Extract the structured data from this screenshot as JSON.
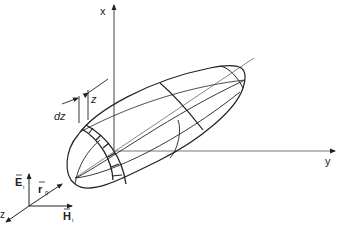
{
  "diagram": {
    "type": "3d-ellipsoid-coordinate-system",
    "axes": {
      "x_label": "x",
      "y_label": "y",
      "z_label": "z"
    },
    "annotations": {
      "slice_position": "z",
      "slice_thickness": "dz"
    },
    "vectors": {
      "electric_field": "E",
      "electric_field_sub": "i",
      "magnetic_field": "H",
      "magnetic_field_sub": "i",
      "position": "r",
      "position_sub": "0"
    },
    "colors": {
      "stroke": "#222222",
      "axis": "#555555",
      "background": "#ffffff"
    }
  }
}
